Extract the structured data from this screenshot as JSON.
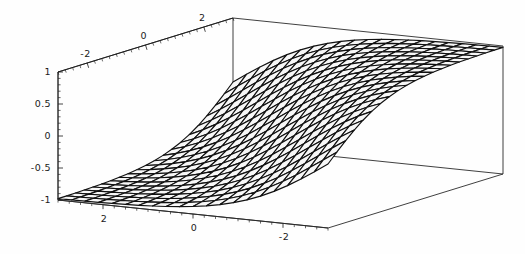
{
  "figure": {
    "kind": "3d-surface-plot",
    "style": "mathematica-wireframe",
    "background_color": "#ffffff",
    "mesh_color": "#111111",
    "face_color": "#f7f7f7",
    "axis_color": "#1a1a1a"
  },
  "chart_data": {
    "type": "surface3d",
    "title": "",
    "xlabel": "",
    "ylabel": "",
    "zlabel": "",
    "grid": false,
    "legend": "none",
    "x": {
      "label": "",
      "range": [
        -3,
        3
      ],
      "display_direction": "decreasing-left-to-right",
      "tick_labels": [
        "2",
        "0",
        "-2"
      ],
      "tick_values": [
        2,
        0,
        -2
      ],
      "minor_ticks_between": 4,
      "axis_position": "bottom-front"
    },
    "y": {
      "label": "",
      "range": [
        -3,
        3
      ],
      "display_direction": "increasing-left-to-right",
      "tick_labels": [
        "-2",
        "0",
        "2"
      ],
      "tick_values": [
        -2,
        0,
        2
      ],
      "minor_ticks_between": 4,
      "axis_position": "top-back"
    },
    "z": {
      "label": "",
      "range": [
        -1,
        1
      ],
      "tick_labels": [
        "1",
        "0.5",
        "0",
        "-0.5",
        "-1"
      ],
      "tick_values": [
        1,
        0.5,
        0,
        -0.5,
        -1
      ],
      "minor_ticks_between": 4,
      "axis_position": "left-front"
    },
    "surface": {
      "function": "tanh-like sigmoid ridge rising from front-left low corner to back-right high plateau",
      "nx": 20,
      "ny": 20,
      "zmin": -1,
      "zmax": 1,
      "description": "Smooth monotone saturating surface; values near -1 at front-left, near +1 at back-right, with a broad S-shaped transition band across the middle."
    },
    "view": {
      "elevation_deg": 24,
      "azimuth_deg": -37,
      "projection": "orthographic",
      "bounding_box": "visible-wireframe"
    }
  },
  "axis_labels": {
    "z_ticks": [
      "1",
      "0.5",
      "0",
      "-0.5",
      "-1"
    ],
    "y_ticks": [
      "-2",
      "0",
      "2"
    ],
    "x_ticks": [
      "2",
      "0",
      "-2"
    ]
  }
}
